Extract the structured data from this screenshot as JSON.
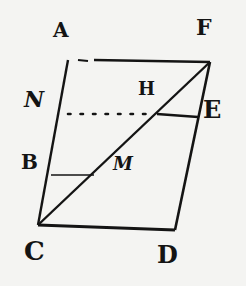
{
  "figure": {
    "type": "geometric parallelogram diagram",
    "colors": {
      "ink": "#141414",
      "paper": "#f4f4f2"
    },
    "points": {
      "A": {
        "label": "A",
        "x": 68,
        "y": 60
      },
      "F": {
        "label": "F",
        "x": 210,
        "y": 62
      },
      "C": {
        "label": "C",
        "x": 38,
        "y": 225
      },
      "D": {
        "label": "D",
        "x": 175,
        "y": 230
      },
      "N": {
        "label": "N",
        "x": 59,
        "y": 114
      },
      "E": {
        "label": "E",
        "x": 198,
        "y": 117
      },
      "H": {
        "label": "H",
        "x": 157,
        "y": 114
      },
      "B": {
        "label": "B",
        "x": 49,
        "y": 175
      },
      "M": {
        "label": "M",
        "x": 93,
        "y": 175
      }
    },
    "labels": {
      "A": "A",
      "F": "F",
      "N": "N",
      "H": "H",
      "E": "E",
      "B": "B",
      "M": "M",
      "C": "C",
      "D": "D"
    },
    "segments": [
      {
        "from": "A",
        "to": "F",
        "style": "solid-partially-broken"
      },
      {
        "from": "F",
        "to": "D",
        "style": "solid"
      },
      {
        "from": "D",
        "to": "C",
        "style": "solid"
      },
      {
        "from": "C",
        "to": "A",
        "style": "solid"
      },
      {
        "from": "C",
        "to": "F",
        "style": "solid",
        "note": "diagonal"
      },
      {
        "from": "N",
        "to": "H",
        "style": "dotted"
      },
      {
        "from": "H",
        "to": "E",
        "style": "solid"
      },
      {
        "from": "B",
        "to": "M",
        "style": "solid-thin"
      }
    ]
  }
}
